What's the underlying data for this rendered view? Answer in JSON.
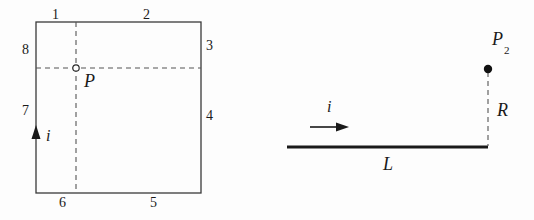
{
  "figure": {
    "background_color": "#fdfdfd",
    "stroke_color": "#2b2b2b",
    "dashed_color": "#555555"
  },
  "left_diagram": {
    "name": "square-current-loop",
    "segment_labels": [
      {
        "id": "1",
        "text": "1",
        "x": 52,
        "y": 8
      },
      {
        "id": "2",
        "text": "2",
        "x": 143,
        "y": 8
      },
      {
        "id": "3",
        "text": "3",
        "x": 206,
        "y": 39
      },
      {
        "id": "4",
        "text": "4",
        "x": 206,
        "y": 109
      },
      {
        "id": "5",
        "text": "5",
        "x": 150,
        "y": 196
      },
      {
        "id": "6",
        "text": "6",
        "x": 59,
        "y": 196
      },
      {
        "id": "7",
        "text": "7",
        "x": 22,
        "y": 104
      },
      {
        "id": "8",
        "text": "8",
        "x": 22,
        "y": 43
      }
    ],
    "point_label": {
      "text": "P",
      "x": 84,
      "y": 72
    },
    "current_label": {
      "text": "i",
      "x": 46,
      "y": 128
    },
    "square": {
      "left": 36,
      "top": 22,
      "right": 201,
      "bottom": 193
    },
    "center_point": {
      "x": 76,
      "y": 68
    }
  },
  "right_diagram": {
    "name": "straight-wire-field-point",
    "point_label": {
      "text": "P",
      "subscript": "2",
      "x": 492,
      "y": 30
    },
    "distance_label": {
      "text": "R",
      "x": 497,
      "y": 101
    },
    "length_label": {
      "text": "L",
      "x": 383,
      "y": 155
    },
    "current_label": {
      "text": "i",
      "x": 327,
      "y": 99
    },
    "wire": {
      "x1": 287,
      "x2": 488,
      "y": 147
    },
    "field_point": {
      "x": 488,
      "y": 69
    },
    "arrow": {
      "x1": 310,
      "x2": 348,
      "y": 127
    }
  }
}
